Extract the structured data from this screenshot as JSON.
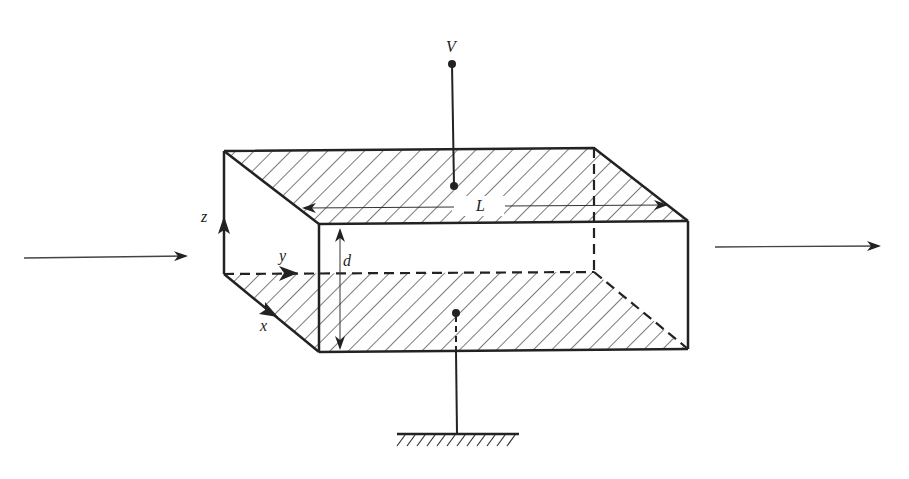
{
  "diagram": {
    "labels": {
      "voltage": "V",
      "length": "L",
      "separation": "d",
      "axis_x": "x",
      "axis_y": "y",
      "axis_z": "z"
    },
    "elements": {
      "top_plate": "hatched top conducting plate",
      "bottom_plate": "hatched bottom conducting plate",
      "voltage_terminal": "terminal connected to top plate",
      "ground": "ground symbol connected to bottom plate",
      "incoming_arrow": "incident direction arrow (left)",
      "outgoing_arrow": "outgoing direction arrow (right)"
    },
    "colors": {
      "ink": "#222222",
      "background": "#ffffff"
    }
  }
}
